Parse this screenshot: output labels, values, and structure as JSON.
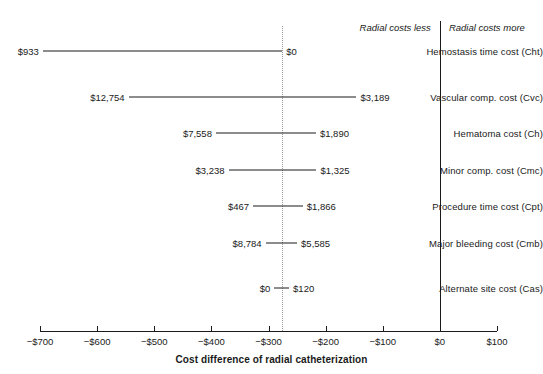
{
  "chart_data": {
    "type": "bar",
    "subtype": "tornado-diagram",
    "title": "",
    "xlabel": "Cost difference of radial catheterization",
    "ylabel": "",
    "xlim": [
      -750,
      120
    ],
    "xticks": [
      -700,
      -600,
      -500,
      -400,
      -300,
      -200,
      -100,
      0,
      100
    ],
    "xtick_labels": [
      "−$700",
      "−$600",
      "−$500",
      "−$400",
      "−$300",
      "−$200",
      "−$100",
      "$0",
      "$100"
    ],
    "grid": false,
    "legend": null,
    "baseline_value": -276,
    "zero_line": 0,
    "annotations": [
      {
        "text": "Radial costs less",
        "side": "left-of-zero"
      },
      {
        "text": "Radial costs more",
        "side": "right-of-zero"
      }
    ],
    "categories": [
      "Hemostasis time cost (Cht)",
      "Vascular comp. cost (Cvc)",
      "Hematoma cost (Ch)",
      "Minor comp. cost (Cmc)",
      "Procedure time cost (Cpt)",
      "Major bleeding cost (Cmb)",
      "Alternate site cost (Cas)"
    ],
    "rows": [
      {
        "label": "Hemostasis time cost (Cht)",
        "low_label": "$933",
        "high_label": "$0",
        "low_x": -695,
        "high_x": -276
      },
      {
        "label": "Vascular comp. cost (Cvc)",
        "low_label": "$12,754",
        "high_label": "$3,189",
        "low_x": -545,
        "high_x": -146
      },
      {
        "label": "Hematoma cost (Ch)",
        "low_label": "$7,558",
        "high_label": "$1,890",
        "low_x": -392,
        "high_x": -217
      },
      {
        "label": "Minor comp. cost (Cmc)",
        "low_label": "$3,238",
        "high_label": "$1,325",
        "low_x": -370,
        "high_x": -216
      },
      {
        "label": "Procedure time cost (Cpt)",
        "low_label": "$467",
        "high_label": "$1,866",
        "low_x": -327,
        "high_x": -240
      },
      {
        "label": "Major bleeding cost (Cmb)",
        "low_label": "$8,784",
        "high_label": "$5,585",
        "low_x": -305,
        "high_x": -250
      },
      {
        "label": "Alternate site cost (Cas)",
        "low_label": "$0",
        "high_label": "$120",
        "low_x": -290,
        "high_x": -264
      }
    ]
  },
  "colors": {
    "bar": "#1a1a1a",
    "baseline": "#9a9a9a",
    "axis": "#1a1a1a",
    "background": "#ffffff"
  }
}
